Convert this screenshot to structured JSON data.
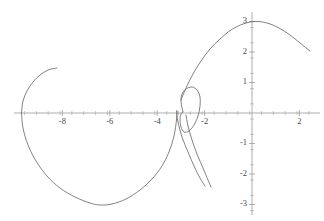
{
  "chart_data": {
    "type": "line",
    "title": "",
    "subtitle": "",
    "xlabel": "",
    "ylabel": "",
    "xlim": [
      -9.8,
      3.0
    ],
    "ylim": [
      -3.3,
      3.3
    ],
    "grid": false,
    "legend": null,
    "background_color": "#ffffff",
    "curve_color": "#6b6b6b",
    "axis_color": "#9a9a9a",
    "label_color": "#4a4a4a",
    "origin_px": {
      "x": 252,
      "y": 113
    },
    "scale_px_per_unit": {
      "x": 23.7,
      "y": 30.5
    },
    "x_axis": {
      "tick_labels": [
        "-8",
        "-6",
        "-4",
        "-2",
        "2"
      ],
      "tick_values": [
        -8,
        -6,
        -4,
        -2,
        2
      ],
      "minor_tick_step": 0.5,
      "minor_tick_range": [
        -9.6,
        2.8
      ]
    },
    "y_axis": {
      "tick_labels": [
        "3",
        "2",
        "1",
        "-1",
        "-2",
        "-3"
      ],
      "tick_values": [
        3,
        2,
        1,
        -1,
        -2,
        -3
      ],
      "minor_tick_step": 0.5,
      "minor_tick_range": [
        -3.2,
        3.2
      ]
    },
    "series": [
      {
        "name": "branch-upper-left-arc",
        "comment": "Upper-left arc from endpoint near (-8.3, 1.5) sweeping left and down to the x-axis crossing near (-9.7, 0)",
        "points_px": [
          [
            57,
            68
          ],
          [
            48,
            70
          ],
          [
            40,
            75
          ],
          [
            33,
            82
          ],
          [
            27,
            91
          ],
          [
            23,
            101
          ],
          [
            21.5,
            113
          ]
        ]
      },
      {
        "name": "branch-large-lower-lobe",
        "comment": "From x-axis crossing near (-9.7, 0) sweeping down around the bottom and back up to the cusp near (-3.2, 0.1)",
        "points_px": [
          [
            21.5,
            113
          ],
          [
            23,
            128
          ],
          [
            28,
            145
          ],
          [
            36,
            161
          ],
          [
            47,
            176
          ],
          [
            60,
            188
          ],
          [
            75,
            197
          ],
          [
            90,
            203
          ],
          [
            100,
            205
          ],
          [
            112,
            204
          ],
          [
            126,
            199
          ],
          [
            140,
            190
          ],
          [
            152,
            179
          ],
          [
            162,
            166
          ],
          [
            169,
            152
          ],
          [
            174,
            136
          ],
          [
            176.5,
            120
          ],
          [
            177,
            111
          ]
        ]
      },
      {
        "name": "branch-cusp-left-tail",
        "comment": "Left descending tail from the cusp down to the lower-right end near (-2.0, -2.4)",
        "points_px": [
          [
            176.5,
            111
          ],
          [
            178,
            122
          ],
          [
            182,
            137
          ],
          [
            188,
            152
          ],
          [
            194,
            166
          ],
          [
            200,
            178
          ],
          [
            205,
            186
          ]
        ]
      },
      {
        "name": "branch-cusp-right-tail",
        "comment": "Right descending tail, nearly parallel to the left tail, from near the loop base down to (-1.9, -2.35)",
        "points_px": [
          [
            186,
            115
          ],
          [
            188,
            126
          ],
          [
            192,
            140
          ],
          [
            197,
            154
          ],
          [
            203,
            168
          ],
          [
            208,
            180
          ],
          [
            211,
            187
          ]
        ]
      },
      {
        "name": "branch-small-loop",
        "comment": "Small closed loop centered near (-2.65, 0.1), roughly 22 px wide and 42 px tall",
        "points_px": [
          [
            183,
            112
          ],
          [
            181,
            102
          ],
          [
            182,
            94
          ],
          [
            186,
            89
          ],
          [
            192,
            87
          ],
          [
            197,
            90
          ],
          [
            200,
            97
          ],
          [
            200,
            106
          ],
          [
            198,
            116
          ],
          [
            194,
            125
          ],
          [
            189,
            131
          ],
          [
            184,
            132
          ],
          [
            181,
            127
          ],
          [
            180,
            120
          ],
          [
            181,
            114
          ],
          [
            183,
            112
          ]
        ]
      },
      {
        "name": "branch-right-arch",
        "comment": "Tall arch rising from near the loop top, peaking at (0.1, 3.0) and descending to the right endpoint near (2.45, 1.95)",
        "points_px": [
          [
            181,
            100
          ],
          [
            186,
            88
          ],
          [
            193,
            74
          ],
          [
            201,
            61
          ],
          [
            210,
            49
          ],
          [
            220,
            39
          ],
          [
            231,
            30
          ],
          [
            243,
            24
          ],
          [
            255,
            21.5
          ],
          [
            267,
            23
          ],
          [
            279,
            28
          ],
          [
            290,
            35
          ],
          [
            300,
            43
          ],
          [
            310,
            51
          ]
        ]
      }
    ]
  }
}
